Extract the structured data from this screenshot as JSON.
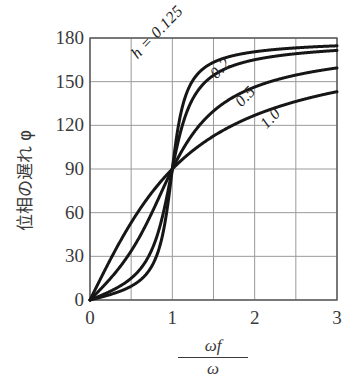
{
  "chart_data": {
    "type": "line",
    "title": "",
    "xlabel": "ωf/ω",
    "xlabel_numerator": "ωf",
    "xlabel_denominator": "ω",
    "ylabel": "位相の遅れ φ",
    "xlim": [
      0,
      3
    ],
    "ylim": [
      0,
      180
    ],
    "grid": true,
    "legend_position": "inline-curve-labels",
    "x_ticks": [
      "0",
      "1",
      "2",
      "3"
    ],
    "x_tick_values": [
      0,
      1,
      2,
      3
    ],
    "x_gridlines": [
      0,
      0.5,
      1,
      1.5,
      2,
      2.5,
      3
    ],
    "y_ticks": [
      "0",
      "30",
      "60",
      "90",
      "120",
      "150",
      "180"
    ],
    "y_tick_values": [
      0,
      30,
      60,
      90,
      120,
      150,
      180
    ],
    "y_gridlines": [
      0,
      30,
      60,
      90,
      120,
      150,
      180
    ],
    "series": [
      {
        "name": "h = 0.125",
        "h": 0.125,
        "label": "h = 0.125",
        "x": [
          0,
          0.1,
          0.2,
          0.3,
          0.4,
          0.5,
          0.6,
          0.7,
          0.8,
          0.85,
          0.9,
          0.95,
          1.0,
          1.05,
          1.1,
          1.15,
          1.2,
          1.3,
          1.4,
          1.5,
          1.6,
          1.8,
          2.0,
          2.25,
          2.5,
          2.75,
          3.0
        ],
        "values": [
          0,
          1.4,
          3.0,
          4.9,
          7.1,
          9.9,
          13.5,
          18.6,
          27.0,
          34.2,
          45.0,
          62.0,
          90,
          118,
          135,
          145.8,
          152.9,
          161.2,
          165.8,
          168.7,
          170.6,
          173.1,
          174.6,
          175.8,
          176.6,
          177.2,
          177.6
        ]
      },
      {
        "name": "0.2",
        "h": 0.2,
        "label": "0.2",
        "x": [
          0,
          0.1,
          0.2,
          0.3,
          0.4,
          0.5,
          0.6,
          0.7,
          0.8,
          0.85,
          0.9,
          0.95,
          1.0,
          1.05,
          1.1,
          1.15,
          1.2,
          1.3,
          1.4,
          1.5,
          1.6,
          1.8,
          2.0,
          2.25,
          2.5,
          2.75,
          3.0
        ],
        "values": [
          0,
          2.3,
          4.8,
          7.8,
          11.3,
          15.6,
          21.2,
          28.9,
          40.4,
          49.3,
          60.8,
          75.7,
          90,
          118.4,
          133.7,
          142.1,
          147.4,
          153.9,
          157.7,
          160.2,
          162.0,
          164.4,
          166.0,
          167.5,
          168.6,
          169.5,
          170.2
        ]
      },
      {
        "name": "0.5",
        "h": 0.5,
        "label": "0.5",
        "x": [
          0,
          0.1,
          0.2,
          0.3,
          0.4,
          0.5,
          0.6,
          0.7,
          0.8,
          0.85,
          0.9,
          0.95,
          1.0,
          1.05,
          1.1,
          1.15,
          1.2,
          1.3,
          1.4,
          1.5,
          1.6,
          1.8,
          2.0,
          2.25,
          2.5,
          2.75,
          3.0
        ],
        "values": [
          0,
          5.8,
          11.8,
          18.4,
          25.9,
          33.7,
          43.2,
          54.5,
          65.8,
          72.6,
          78.1,
          84.2,
          90,
          95.8,
          101.3,
          106.3,
          110.9,
          118.6,
          124.6,
          129.4,
          133.3,
          139.1,
          143.1,
          146.9,
          149.7,
          151.9,
          153.6
        ]
      },
      {
        "name": "1.0",
        "h": 1.0,
        "label": "1.0",
        "x": [
          0,
          0.1,
          0.2,
          0.3,
          0.4,
          0.5,
          0.6,
          0.7,
          0.8,
          0.85,
          0.9,
          0.95,
          1.0,
          1.05,
          1.1,
          1.15,
          1.2,
          1.3,
          1.4,
          1.5,
          1.6,
          1.8,
          2.0,
          2.25,
          2.5,
          2.75,
          3.0
        ],
        "values": [
          0,
          11.5,
          23.6,
          33.4,
          43.0,
          53.1,
          61.9,
          71.3,
          77.3,
          82.2,
          85.1,
          87.6,
          90,
          92.4,
          94.9,
          97.8,
          100.4,
          106.2,
          111.5,
          115.9,
          119.8,
          126.2,
          131.0,
          135.5,
          139.0,
          141.8,
          144.0
        ]
      }
    ],
    "curve_label_positions": [
      {
        "label": "h = 0.125",
        "left": 134,
        "top": 48,
        "rotate": -46
      },
      {
        "label": "0.2",
        "left": 213,
        "top": 68,
        "rotate": -46
      },
      {
        "label": "0.5",
        "left": 238,
        "top": 96,
        "rotate": -46
      },
      {
        "label": "1.0",
        "left": 263,
        "top": 118,
        "rotate": -46
      }
    ],
    "colors": {
      "background": "#ffffff",
      "curve": "#161616",
      "grid": "#9a9a9a",
      "axis": "#555555",
      "text": "#3a3a3a"
    },
    "annotations": [
      "All curves pass through (1, 90)"
    ]
  }
}
